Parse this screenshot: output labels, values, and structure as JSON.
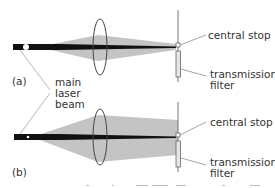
{
  "panels": [
    {
      "id": "a",
      "label": "(a)"
    },
    {
      "id": "b",
      "label": "(b)"
    }
  ],
  "labels": {
    "main_beam_line1": "main",
    "main_beam_line2": "laser",
    "main_beam_line3": "beam",
    "central_stop": "central stop",
    "transmission_filter_line1": "transmission",
    "transmission_filter_line2": "filter"
  },
  "colors": {
    "beam": "#111111",
    "cone": "#c4c4c4",
    "lens": "#444444",
    "filter": "#e6e6e6",
    "text": "#333333"
  }
}
